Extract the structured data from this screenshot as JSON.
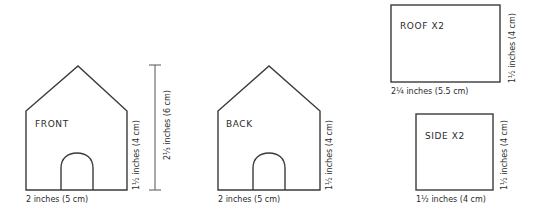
{
  "diagram": {
    "colors": {
      "line": "#3a3a3a",
      "text": "#2b2b2b",
      "background": "#ffffff"
    },
    "pieces": {
      "front": {
        "label": "FRONT",
        "width_label": "2 inches (5 cm)",
        "wall_height_label": "1½ inches (4 cm)",
        "total_height_label": "2⅓ inches (6 cm)"
      },
      "back": {
        "label": "BACK",
        "width_label": "2 inches (5 cm)",
        "wall_height_label": "1½ inches (4 cm)"
      },
      "roof": {
        "label": "ROOF X2",
        "width_label": "2¼ inches (5.5 cm)",
        "height_label": "1½ inches (4 cm)"
      },
      "side": {
        "label": "SIDE X2",
        "width_label": "1½ inches (4 cm)",
        "height_label": "1½ inches (4 cm)"
      }
    }
  }
}
